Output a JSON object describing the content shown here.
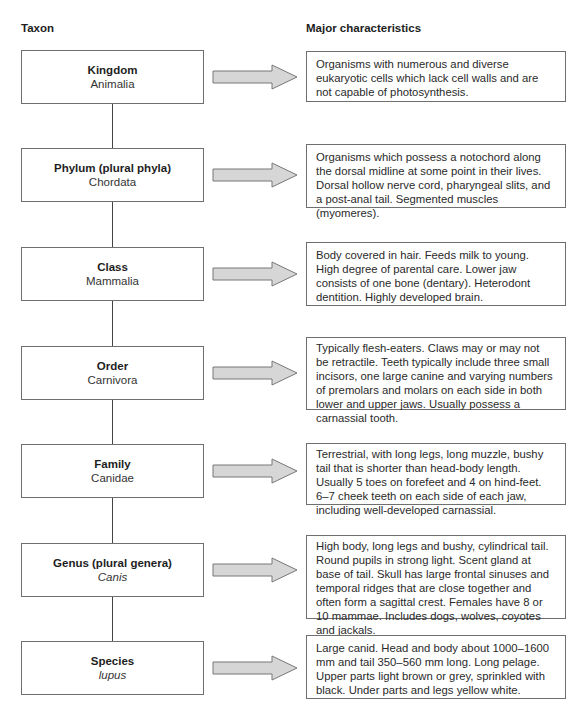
{
  "headers": {
    "taxon": "Taxon",
    "characteristics": "Major characteristics"
  },
  "colors": {
    "box_border": "#6f6f6f",
    "arrow_fill": "#d6d6d6",
    "arrow_stroke": "#777777",
    "connector": "#444444"
  },
  "levels": [
    {
      "rank": "Kingdom",
      "name": "Animalia",
      "italic": false,
      "description": "Organisms with numerous and diverse eukaryotic cells which lack cell walls and are not capable of photosynthesis."
    },
    {
      "rank": "Phylum (plural phyla)",
      "name": "Chordata",
      "italic": false,
      "description": "Organisms which possess a notochord along the dorsal midline at some point in their lives. Dorsal hollow nerve cord, pharyngeal slits, and a post-anal tail. Segmented muscles (myomeres)."
    },
    {
      "rank": "Class",
      "name": "Mammalia",
      "italic": false,
      "description": "Body covered in hair. Feeds milk to young. High degree of parental care. Lower jaw consists of one bone (dentary). Heterodont dentition. Highly developed brain."
    },
    {
      "rank": "Order",
      "name": "Carnivora",
      "italic": false,
      "description": "Typically flesh-eaters. Claws may or may not be retractile. Teeth typically include three small incisors, one large canine and varying numbers of premolars and molars on each side in both lower and upper jaws. Usually possess a carnassial tooth."
    },
    {
      "rank": "Family",
      "name": "Canidae",
      "italic": false,
      "description": "Terrestrial, with long legs, long muzzle, bushy tail that is shorter than head-body length. Usually 5 toes on forefeet and 4 on hind-feet. 6–7 cheek teeth on each side of each jaw, including well-developed carnassial."
    },
    {
      "rank": "Genus (plural genera)",
      "name": "Canis",
      "italic": true,
      "description": "High body, long legs and bushy, cylindrical tail. Round pupils in strong light. Scent gland at base of tail. Skull has large frontal sinuses and temporal ridges that are close together and often form a sagittal crest. Females have 8 or 10 mammae. Includes dogs, wolves, coyotes and jackals."
    },
    {
      "rank": "Species",
      "name": "lupus",
      "italic": true,
      "description": "Large canid. Head and body about 1000–1600 mm and tail 350–560 mm long. Long pelage. Upper parts light brown or grey, sprinkled with black. Under parts and legs yellow white."
    }
  ]
}
